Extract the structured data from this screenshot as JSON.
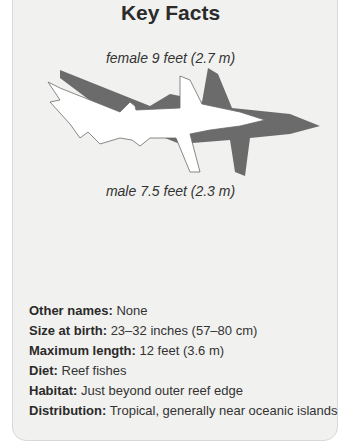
{
  "card": {
    "title": "Key Facts",
    "female_size": "female 9 feet (2.7 m)",
    "male_size": "male 7.5 feet (2.3 m)",
    "illustration": "shark-silhouette-icon",
    "facts": [
      {
        "label": "Other names:",
        "value": " None"
      },
      {
        "label": "Size at birth:",
        "value": " 23–32 inches (57–80 cm)"
      },
      {
        "label": "Maximum length:",
        "value": " 12 feet (3.6 m)"
      },
      {
        "label": "Diet:",
        "value": " Reef fishes"
      },
      {
        "label": "Habitat:",
        "value": " Just beyond outer reef edge"
      },
      {
        "label": "Distribution:",
        "value": " Tropical, generally near oceanic islands"
      }
    ]
  },
  "colors": {
    "card_bg": "#f1f1ef",
    "female_silhouette": "#6b6b6b",
    "male_silhouette": "#ffffff"
  }
}
